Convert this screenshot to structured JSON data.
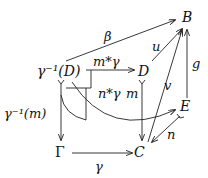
{
  "diagram": {
    "nodes": {
      "B": "B",
      "gD": "γ⁻¹(D)",
      "D": "D",
      "E": "E",
      "Gamma": "Γ",
      "C": "C"
    },
    "edges": {
      "beta": "β",
      "u": "u",
      "g": "g",
      "mstar": "m*γ",
      "nstar": "n*γ",
      "m": "m",
      "v": "v",
      "gm": "γ⁻¹(m)",
      "n": "n",
      "gamma": "γ"
    }
  }
}
